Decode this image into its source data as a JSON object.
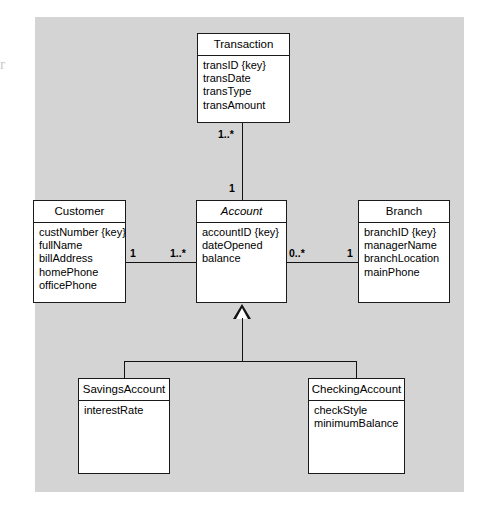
{
  "diagram": {
    "type": "uml-class-diagram",
    "edge_artifact": "r",
    "classes": [
      {
        "id": "transaction",
        "name": "Transaction",
        "abstract": false,
        "attributes": [
          "transID {key}",
          "transDate",
          "transType",
          "transAmount"
        ]
      },
      {
        "id": "customer",
        "name": "Customer",
        "abstract": false,
        "attributes": [
          "custNumber {key}",
          "fullName",
          "billAddress",
          "homePhone",
          "officePhone"
        ]
      },
      {
        "id": "account",
        "name": "Account",
        "abstract": true,
        "attributes": [
          "accountID {key}",
          "dateOpened",
          "balance"
        ]
      },
      {
        "id": "branch",
        "name": "Branch",
        "abstract": false,
        "attributes": [
          "branchID {key}",
          "managerName",
          "branchLocation",
          "mainPhone"
        ]
      },
      {
        "id": "savings_account",
        "name": "SavingsAccount",
        "abstract": false,
        "attributes": [
          "interestRate"
        ]
      },
      {
        "id": "checking_account",
        "name": "CheckingAccount",
        "abstract": false,
        "attributes": [
          "checkStyle",
          "minimumBalance"
        ]
      }
    ],
    "multiplicities": {
      "transaction_to_account": "1..*",
      "account_to_transaction": "1",
      "customer_to_account": "1",
      "account_to_customer": "1..*",
      "account_to_branch": "0..*",
      "branch_to_account": "1"
    },
    "relationships": [
      {
        "from": "Transaction",
        "to": "Account",
        "kind": "association"
      },
      {
        "from": "Customer",
        "to": "Account",
        "kind": "association"
      },
      {
        "from": "Account",
        "to": "Branch",
        "kind": "association"
      },
      {
        "from": "SavingsAccount",
        "to": "Account",
        "kind": "generalization"
      },
      {
        "from": "CheckingAccount",
        "to": "Account",
        "kind": "generalization"
      }
    ],
    "colors": {
      "canvas": "#d4d4d4",
      "box_fill": "#ffffff",
      "stroke": "#121212",
      "page": "#ffffff"
    }
  }
}
